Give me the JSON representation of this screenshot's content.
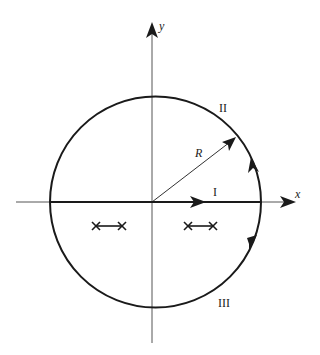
{
  "diagram": {
    "type": "contour-integration-plane",
    "axes": {
      "x_label": "x",
      "y_label": "y"
    },
    "radius_label": "R",
    "segments": [
      {
        "id": "I",
        "label": "I",
        "description": "segment along positive real axis"
      },
      {
        "id": "II",
        "label": "II",
        "description": "upper arc of circle"
      },
      {
        "id": "III",
        "label": "III",
        "description": "lower arc of circle"
      }
    ],
    "poles": [
      {
        "pair": "left",
        "markers": [
          "×",
          "×"
        ]
      },
      {
        "pair": "right",
        "markers": [
          "×",
          "×"
        ]
      }
    ],
    "colors": {
      "stroke": "#1a1a1a",
      "axis": "#555555",
      "background": "#ffffff"
    }
  }
}
